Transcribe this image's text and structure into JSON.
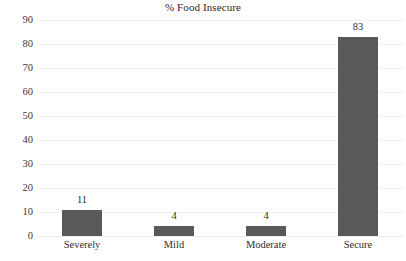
{
  "chart_data": {
    "type": "bar",
    "title": "% Food Insecure",
    "xlabel": "",
    "ylabel": "",
    "categories": [
      "Severely",
      "Mild",
      "Moderate",
      "Secure"
    ],
    "values": [
      11,
      4,
      4,
      83
    ],
    "value_labels": [
      "11",
      "4",
      "4",
      "83"
    ],
    "ylim": [
      0,
      90
    ],
    "ytick_step": 10,
    "yticks": [
      0,
      10,
      20,
      30,
      40,
      50,
      60,
      70,
      80,
      90
    ],
    "ytick_labels": [
      "0",
      "10",
      "20",
      "30",
      "40",
      "50",
      "60",
      "70",
      "80",
      "90"
    ],
    "grid": "horizontal",
    "legend": "none",
    "series": [
      {
        "name": "% Food Insecure",
        "values": [
          11,
          4,
          4,
          83
        ],
        "color": "#595959"
      }
    ],
    "colors": {
      "bar_fill": "#595959",
      "gridline": "#f0f0f0",
      "text": "#2e2e2e",
      "background": "#ffffff"
    }
  }
}
